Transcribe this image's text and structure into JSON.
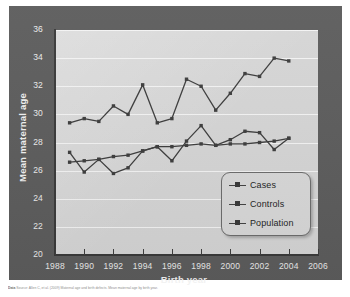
{
  "figure": {
    "y_axis_title": "Mean maternal age",
    "x_axis_title": "Birth year",
    "caption_prefix": "Data",
    "caption_text": "Source: Allen C, et al. (2009) Maternal age and birth defects. Mean maternal age by birth year."
  },
  "legend": {
    "items": [
      {
        "label": "Cases"
      },
      {
        "label": "Controls"
      },
      {
        "label": "Population"
      }
    ]
  },
  "axes": {
    "y_ticks": [
      "36",
      "34",
      "32",
      "30",
      "28",
      "26",
      "24",
      "22",
      "20"
    ],
    "x_ticks": [
      "1988",
      "1990",
      "1992",
      "1994",
      "1996",
      "1998",
      "2000",
      "2002",
      "2004",
      "2006"
    ]
  },
  "colors": {
    "panel": "#5d5d5d",
    "plot_background": "#d6d6d6",
    "gridline": "#f4f4f4",
    "series_line": "#3d3d3d",
    "axis": "#3a3a3a",
    "tick_label": "#ececec",
    "legend_background": "#d9d9d9"
  },
  "chart_data": {
    "type": "line",
    "title": "",
    "xlabel": "Birth year",
    "ylabel": "Mean maternal age",
    "xlim": [
      1988,
      2006
    ],
    "ylim": [
      20,
      36
    ],
    "ytick_step": 2,
    "xtick_step": 2,
    "grid": true,
    "legend_position": "inside-bottom-right",
    "x": [
      1989,
      1990,
      1991,
      1992,
      1993,
      1994,
      1995,
      1996,
      1997,
      1998,
      1999,
      2000,
      2001,
      2002,
      2003,
      2004
    ],
    "series": [
      {
        "name": "Cases",
        "values": [
          29.4,
          29.7,
          29.5,
          30.6,
          30.0,
          32.1,
          29.4,
          29.7,
          32.5,
          32.0,
          30.3,
          31.5,
          32.9,
          32.7,
          34.0,
          33.8
        ]
      },
      {
        "name": "Controls",
        "values": [
          27.3,
          25.9,
          26.8,
          25.8,
          26.2,
          27.4,
          27.7,
          26.7,
          28.1,
          29.2,
          27.8,
          28.2,
          28.8,
          28.7,
          27.5,
          28.3
        ]
      },
      {
        "name": "Population",
        "values": [
          26.6,
          26.7,
          26.8,
          27.0,
          27.1,
          27.4,
          27.7,
          27.7,
          27.8,
          27.9,
          27.8,
          27.9,
          27.9,
          28.0,
          28.1,
          28.3
        ]
      }
    ]
  }
}
